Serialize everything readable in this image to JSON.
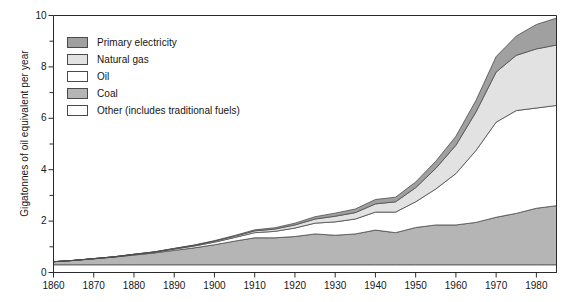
{
  "chart_data": {
    "type": "area",
    "title": "",
    "subtitle": "",
    "xlabel": "",
    "ylabel": "Gigatonnes of oil equivalent per year",
    "xlim": [
      1860,
      1985
    ],
    "ylim": [
      0,
      10
    ],
    "grid": false,
    "stacked": true,
    "stack_order_bottom_to_top": [
      "Other (includes traditional fuels)",
      "Coal",
      "Oil",
      "Natural gas",
      "Primary electricity"
    ],
    "legend_position": "upper-left-inside",
    "x_major_ticks": [
      1860,
      1870,
      1880,
      1890,
      1900,
      1910,
      1920,
      1930,
      1940,
      1950,
      1960,
      1970,
      1980
    ],
    "x_tick_labels": [
      "1860",
      "1870",
      "1880",
      "1890",
      "1900",
      "1910",
      "1920",
      "1930",
      "1940",
      "1950",
      "1960",
      "1970",
      "1980"
    ],
    "y_major_ticks": [
      0,
      2,
      4,
      6,
      8,
      10
    ],
    "y_tick_labels": [
      "0",
      "2",
      "4",
      "6",
      "8",
      "10"
    ],
    "y_minor_ticks": [
      1,
      3,
      5,
      7,
      9
    ],
    "x": [
      1860,
      1865,
      1870,
      1875,
      1880,
      1885,
      1890,
      1895,
      1900,
      1905,
      1910,
      1915,
      1920,
      1925,
      1930,
      1935,
      1940,
      1945,
      1950,
      1955,
      1960,
      1965,
      1970,
      1975,
      1980,
      1985
    ],
    "series": [
      {
        "name": "Other (includes traditional fuels)",
        "color": "#ffffff",
        "values": [
          0.3,
          0.3,
          0.3,
          0.3,
          0.3,
          0.3,
          0.3,
          0.3,
          0.3,
          0.3,
          0.3,
          0.3,
          0.3,
          0.3,
          0.3,
          0.3,
          0.3,
          0.3,
          0.3,
          0.3,
          0.3,
          0.3,
          0.3,
          0.3,
          0.3,
          0.3
        ]
      },
      {
        "name": "Coal",
        "color": "#b5b5b5",
        "values": [
          0.12,
          0.17,
          0.23,
          0.3,
          0.38,
          0.46,
          0.56,
          0.66,
          0.78,
          0.92,
          1.05,
          1.05,
          1.1,
          1.2,
          1.15,
          1.2,
          1.35,
          1.25,
          1.45,
          1.55,
          1.55,
          1.65,
          1.85,
          2.0,
          2.2,
          2.3
        ]
      },
      {
        "name": "Oil",
        "color": "#ffffff",
        "values": [
          0.0,
          0.0,
          0.01,
          0.01,
          0.02,
          0.03,
          0.05,
          0.07,
          0.1,
          0.14,
          0.2,
          0.25,
          0.33,
          0.42,
          0.52,
          0.58,
          0.7,
          0.8,
          1.0,
          1.4,
          2.0,
          2.8,
          3.7,
          4.0,
          3.9,
          3.9
        ]
      },
      {
        "name": "Natural gas",
        "color": "#e2e2e2",
        "values": [
          0.0,
          0.0,
          0.0,
          0.0,
          0.01,
          0.01,
          0.02,
          0.03,
          0.04,
          0.05,
          0.07,
          0.09,
          0.12,
          0.16,
          0.22,
          0.25,
          0.32,
          0.4,
          0.55,
          0.8,
          1.1,
          1.5,
          1.95,
          2.15,
          2.3,
          2.35
        ]
      },
      {
        "name": "Primary electricity",
        "color": "#a0a0a0",
        "values": [
          0.0,
          0.0,
          0.0,
          0.0,
          0.0,
          0.0,
          0.01,
          0.01,
          0.02,
          0.03,
          0.04,
          0.05,
          0.07,
          0.09,
          0.12,
          0.14,
          0.17,
          0.18,
          0.22,
          0.28,
          0.35,
          0.45,
          0.6,
          0.75,
          0.95,
          1.05
        ]
      }
    ],
    "totals": [
      0.42,
      0.47,
      0.54,
      0.61,
      0.71,
      0.8,
      0.94,
      1.07,
      1.24,
      1.44,
      1.66,
      1.74,
      1.92,
      2.17,
      2.31,
      2.47,
      2.84,
      2.93,
      3.52,
      4.33,
      5.3,
      6.7,
      8.4,
      9.2,
      9.65,
      9.9
    ]
  },
  "legend": {
    "items": [
      {
        "label": "Primary electricity",
        "color": "#a0a0a0"
      },
      {
        "label": "Natural gas",
        "color": "#e2e2e2"
      },
      {
        "label": "Oil",
        "color": "#ffffff"
      },
      {
        "label": "Coal",
        "color": "#b5b5b5"
      },
      {
        "label": "Other (includes traditional fuels)",
        "color": "#ffffff"
      }
    ]
  },
  "axes": {
    "y_title": "Gigatonnes of oil equivalent per year",
    "y_labels": [
      "10",
      "8",
      "6",
      "4",
      "2",
      "0"
    ],
    "x_labels": [
      "1860",
      "1870",
      "1880",
      "1890",
      "1900",
      "1910",
      "1920",
      "1930",
      "1940",
      "1950",
      "1960",
      "1970",
      "1980"
    ]
  }
}
